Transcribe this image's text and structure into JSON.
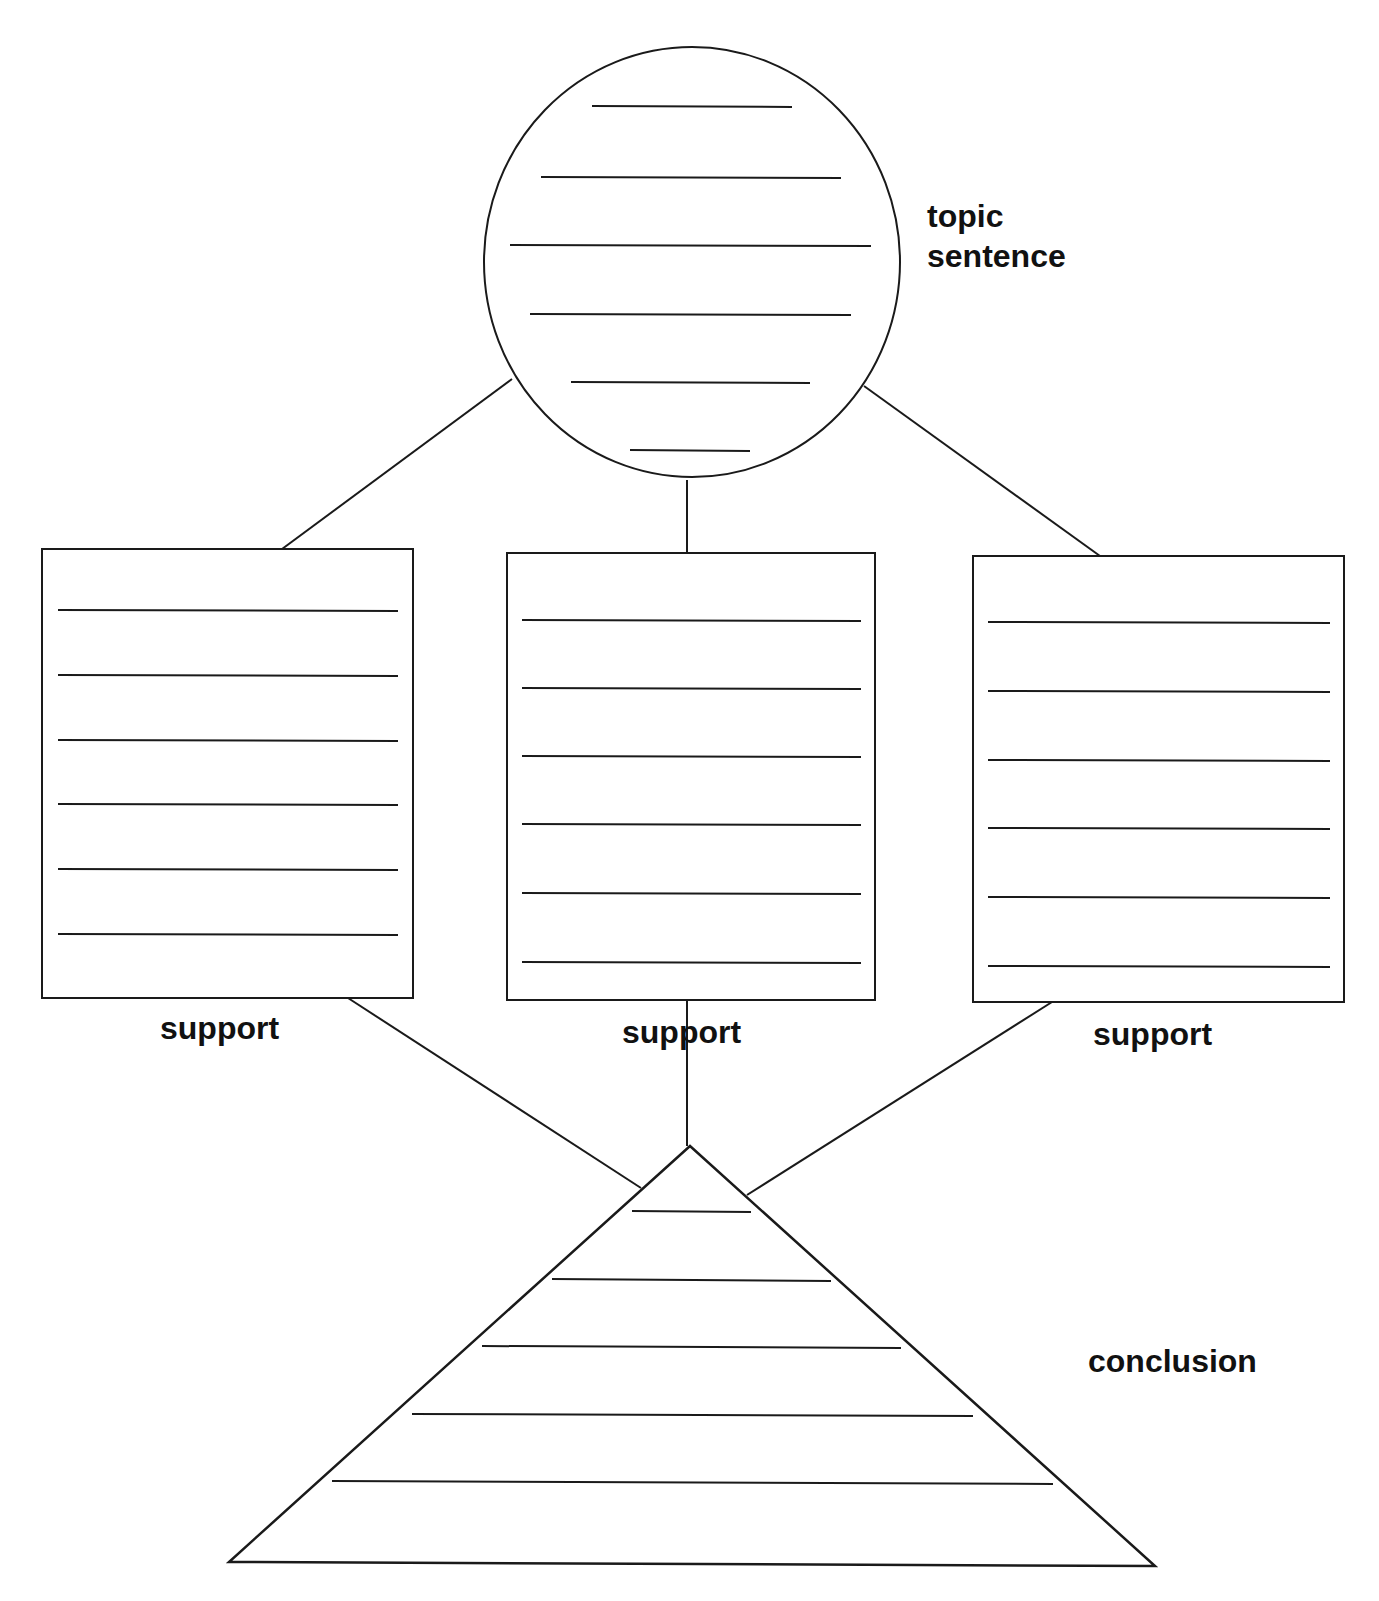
{
  "diagram": {
    "type": "paragraph-organizer",
    "topic": {
      "label_line1": "topic",
      "label_line2": "sentence",
      "writing_lines": 6
    },
    "supports": [
      {
        "label": "support",
        "writing_lines": 6
      },
      {
        "label": "support",
        "writing_lines": 6
      },
      {
        "label": "support",
        "writing_lines": 6
      }
    ],
    "conclusion": {
      "label": "conclusion",
      "writing_lines": 5
    },
    "colors": {
      "stroke": "#1a1a1a",
      "background": "#ffffff"
    }
  }
}
